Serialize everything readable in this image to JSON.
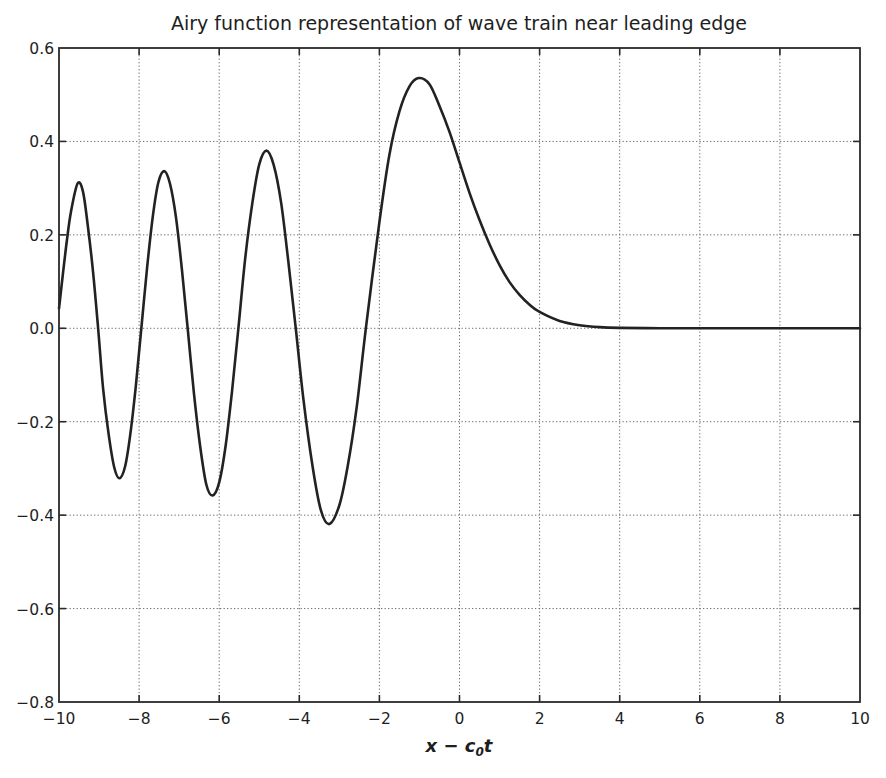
{
  "chart_data": {
    "type": "line",
    "title": "Airy function representation of wave train near leading edge",
    "xlabel": "x − c₀t",
    "xlabel_parts": {
      "main": "x − c",
      "sub": "0",
      "tail": "t"
    },
    "ylabel": "",
    "xlim": [
      -10,
      10
    ],
    "ylim": [
      -0.8,
      0.6
    ],
    "xticks": [
      -10,
      -8,
      -6,
      -4,
      -2,
      0,
      2,
      4,
      6,
      8,
      10
    ],
    "xtick_labels": [
      "−10",
      "−8",
      "−6",
      "−4",
      "−2",
      "0",
      "2",
      "4",
      "6",
      "8",
      "10"
    ],
    "yticks": [
      0.6,
      0.4,
      0.2,
      0.0,
      -0.2,
      -0.4,
      -0.6,
      -0.8
    ],
    "ytick_labels": [
      "0.6",
      "0.4",
      "0.2",
      "0.0",
      "−0.2",
      "−0.4",
      "−0.6",
      "−0.8"
    ],
    "grid": true,
    "grid_style": "dotted",
    "legend": null,
    "line_color": "#222222",
    "series": [
      {
        "name": "Ai(x)",
        "x": [
          -10.0,
          -9.9,
          -9.8,
          -9.7,
          -9.535,
          -9.4,
          -9.28,
          -9.15,
          -9.023,
          -8.9,
          -8.76,
          -8.62,
          -8.489,
          -8.35,
          -8.22,
          -8.08,
          -7.944,
          -7.8,
          -7.66,
          -7.52,
          -7.372,
          -7.23,
          -7.08,
          -6.93,
          -6.787,
          -6.63,
          -6.475,
          -6.32,
          -6.163,
          -6.0,
          -5.842,
          -5.68,
          -5.521,
          -5.35,
          -5.171,
          -5.0,
          -4.82,
          -4.64,
          -4.454,
          -4.27,
          -4.088,
          -3.9,
          -3.668,
          -3.46,
          -3.248,
          -3.0,
          -2.793,
          -2.57,
          -2.338,
          -2.0,
          -1.75,
          -1.5,
          -1.25,
          -1.019,
          -0.75,
          -0.5,
          -0.25,
          0.0,
          0.25,
          0.5,
          0.75,
          1.0,
          1.25,
          1.5,
          1.75,
          2.0,
          2.5,
          3.0,
          3.5,
          4.0,
          5.0,
          6.0,
          7.0,
          8.0,
          9.0,
          10.0
        ],
        "y": [
          0.0424,
          0.118,
          0.19,
          0.25,
          0.3103,
          0.292,
          0.219,
          0.121,
          0.0,
          -0.128,
          -0.227,
          -0.298,
          -0.321,
          -0.296,
          -0.227,
          -0.122,
          0.0,
          0.13,
          0.238,
          0.312,
          0.3365,
          0.31,
          0.238,
          0.125,
          0.0,
          -0.14,
          -0.253,
          -0.335,
          -0.3579,
          -0.33,
          -0.253,
          -0.135,
          0.0,
          0.15,
          0.269,
          0.3508,
          0.3804,
          0.35,
          0.269,
          0.14,
          0.0,
          -0.15,
          -0.296,
          -0.39,
          -0.419,
          -0.3788,
          -0.296,
          -0.171,
          0.0,
          0.2274,
          0.3714,
          0.4642,
          0.5178,
          0.5357,
          0.5225,
          0.4757,
          0.4204,
          0.355,
          0.2899,
          0.2317,
          0.18,
          0.1353,
          0.0988,
          0.0717,
          0.0506,
          0.0349,
          0.0157,
          0.0066,
          0.0025,
          0.00095,
          0.0001,
          0.0,
          0.0,
          0.0,
          0.0,
          0.0
        ]
      }
    ]
  }
}
